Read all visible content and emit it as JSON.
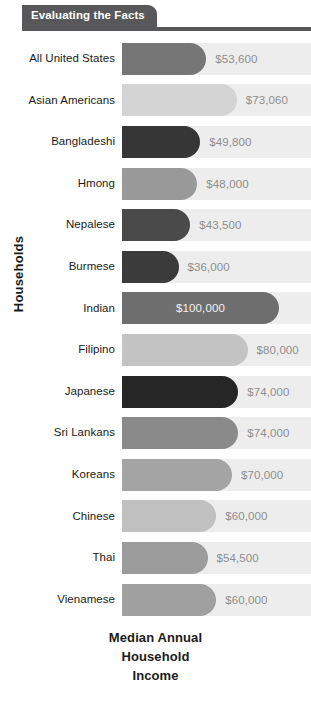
{
  "header": {
    "tab_label": "Evaluating the Facts"
  },
  "axes": {
    "y_title": "Households",
    "x_title_lines": [
      "Median Annual",
      "Household",
      "Income"
    ]
  },
  "colors": {
    "header_bar": "#58585a",
    "track": "#ededed",
    "label_text": "#1b1b1b",
    "value_text": "#8d8d8d",
    "value_text_inside": "#f2f2f2"
  },
  "chart_data": {
    "type": "bar",
    "orientation": "horizontal",
    "title": "Evaluating the Facts",
    "xlabel": "Median Annual Household Income",
    "ylabel": "Households",
    "xlim": [
      0,
      100000
    ],
    "grid": false,
    "legend": "none",
    "value_prefix": "$",
    "categories": [
      "All United States",
      "Asian Americans",
      "Bangladeshi",
      "Hmong",
      "Nepalese",
      "Burmese",
      "Indian",
      "Filipino",
      "Japanese",
      "Sri Lankans",
      "Koreans",
      "Chinese",
      "Thai",
      "Vienamese"
    ],
    "values": [
      53600,
      73060,
      49800,
      48000,
      43500,
      36000,
      100000,
      80000,
      74000,
      74000,
      70000,
      60000,
      54500,
      60000
    ],
    "value_labels": [
      "$53,600",
      "$73,060",
      "$49,800",
      "$48,000",
      "$43,500",
      "$36,000",
      "$100,000",
      "$80,000",
      "$74,000",
      "$74,000",
      "$70,000",
      "$60,000",
      "$54,500",
      "$60,000"
    ],
    "bar_colors": [
      "#767676",
      "#d4d4d4",
      "#363636",
      "#999999",
      "#4a4a4a",
      "#3b3b3b",
      "#6e6e6e",
      "#c4c4c4",
      "#262626",
      "#8a8a8a",
      "#a4a4a4",
      "#c0c0c0",
      "#9c9c9c",
      "#a0a0a0"
    ],
    "label_inside_bar": [
      false,
      false,
      false,
      false,
      false,
      false,
      true,
      false,
      false,
      false,
      false,
      false,
      false,
      false
    ]
  }
}
